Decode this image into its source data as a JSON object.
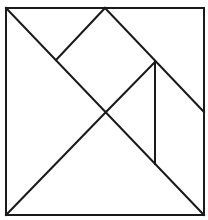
{
  "diagram": {
    "canvas": {
      "width": 208,
      "height": 220,
      "background": "#ffffff"
    },
    "stroke": {
      "color": "#1a1a1a",
      "width": 2
    },
    "square": {
      "x": 6,
      "y": 8,
      "width": 198,
      "height": 207
    },
    "lines": [
      {
        "name": "main-diagonal",
        "x1": 6,
        "y1": 8,
        "x2": 204,
        "y2": 215
      },
      {
        "name": "anti-diagonal-lower",
        "x1": 6,
        "y1": 215,
        "x2": 106,
        "y2": 112
      },
      {
        "name": "top-mid-to-right",
        "x1": 105,
        "y1": 8,
        "x2": 204,
        "y2": 112
      },
      {
        "name": "top-mid-to-left-diagonal",
        "x1": 105,
        "y1": 8,
        "x2": 56,
        "y2": 60
      },
      {
        "name": "center-to-right-diagonal",
        "x1": 106,
        "y1": 112,
        "x2": 155,
        "y2": 62
      },
      {
        "name": "vertical-segment",
        "x1": 155,
        "y1": 62,
        "x2": 155,
        "y2": 164
      }
    ]
  }
}
